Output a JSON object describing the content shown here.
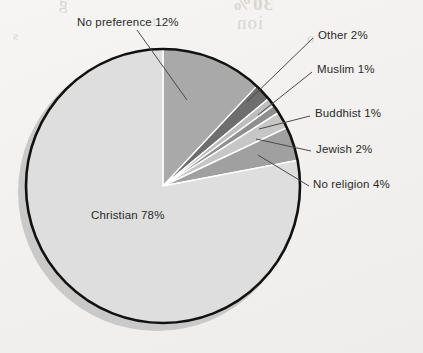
{
  "chart_data": {
    "type": "pie",
    "title": "",
    "subtitle": "",
    "xlabel": "",
    "ylabel": "",
    "legend_position": "none",
    "labels_position": "callout",
    "unit": "%",
    "total": 100,
    "start_angle_deg": 0,
    "direction": "clockwise",
    "categories": [
      "No preference",
      "Other",
      "Muslim",
      "Buddhist",
      "Jewish",
      "No religion",
      "Christian"
    ],
    "values": [
      12,
      2,
      1,
      1,
      2,
      4,
      78
    ],
    "slices": [
      {
        "label": "No preference",
        "value": 12,
        "text": "No preference 12%",
        "color": "#a9a9a9"
      },
      {
        "label": "Other",
        "value": 2,
        "text": "Other 2%",
        "color": "#6e6e6e"
      },
      {
        "label": "Muslim",
        "value": 1,
        "text": "Muslim 1%",
        "color": "#bdbdbd"
      },
      {
        "label": "Buddhist",
        "value": 1,
        "text": "Buddhist 1%",
        "color": "#8f8f8f"
      },
      {
        "label": "Jewish",
        "value": 2,
        "text": "Jewish 2%",
        "color": "#c6c6c6"
      },
      {
        "label": "No religion",
        "value": 4,
        "text": "No religion 4%",
        "color": "#a0a0a0"
      },
      {
        "label": "Christian",
        "value": 78,
        "text": "Christian 78%",
        "color": "#dedede"
      }
    ],
    "annotations": [
      "No preference 12%",
      "Other 2%",
      "Muslim 1%",
      "Buddhist 1%",
      "Jewish 2%",
      "No religion 4%",
      "Christian 78%"
    ]
  },
  "labels": {
    "no_preference": "No preference 12%",
    "other": "Other 2%",
    "muslim": "Muslim 1%",
    "buddhist": "Buddhist 1%",
    "jewish": "Jewish 2%",
    "no_religion": "No religion 4%",
    "christian": "Christian 78%"
  },
  "bleed_through": {
    "l1": "g",
    "l2": "30%",
    "l3": "ion",
    "l4": "1",
    "l5": "o",
    "l6": "s"
  },
  "colors": {
    "page_background": "#f3f2f0",
    "outline": "#111111",
    "shadow": "#c9c9c9",
    "leader_line": "#4a4a4a",
    "text": "#2a2a2a",
    "slice_christian": "#dedede",
    "slice_no_preference": "#a9a9a9",
    "slice_other": "#6e6e6e",
    "slice_muslim": "#bdbdbd",
    "slice_buddhist": "#8f8f8f",
    "slice_jewish": "#c6c6c6",
    "slice_no_religion": "#a0a0a0"
  },
  "geometry": {
    "center_x": 163,
    "center_y": 186,
    "radius": 137
  }
}
